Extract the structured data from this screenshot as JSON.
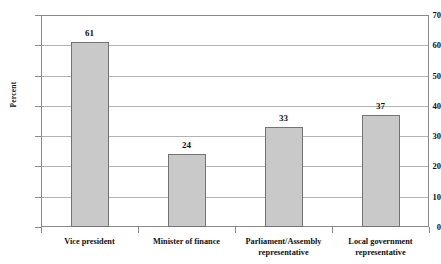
{
  "chart_data": {
    "type": "bar",
    "title": "",
    "subtitle": "",
    "xlabel": "",
    "ylabel": "Percent",
    "ylim": [
      0,
      70
    ],
    "y_ticks": [
      0,
      10,
      20,
      30,
      40,
      50,
      60,
      70
    ],
    "y_tick_labels": [
      "0",
      "10",
      "20",
      "30",
      "40",
      "50",
      "60",
      "70"
    ],
    "grid": true,
    "legend": null,
    "legend_position": "none",
    "categories": [
      "Vice president",
      "Minister of finance",
      "Parliament/Assembly\nrepresentative",
      "Local government\nrepresentative"
    ],
    "values": [
      61,
      24,
      33,
      37
    ],
    "data_labels": [
      "61",
      "24",
      "33",
      "37"
    ],
    "series": [
      {
        "name": "Percent",
        "values": [
          61,
          24,
          33,
          37
        ]
      }
    ],
    "colors": {
      "bar_fill": "#c9c9c9",
      "bar_border": "#737373",
      "gridline": "#b3b3b3",
      "axis": "#8a8a8a",
      "text": "#111111",
      "background": "#ffffff"
    }
  }
}
